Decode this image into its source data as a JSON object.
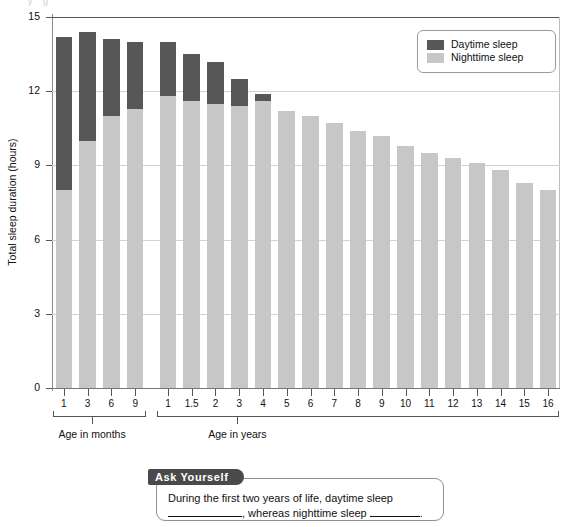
{
  "figure": {
    "top_cut_text": "y  g"
  },
  "chart_data": {
    "type": "bar",
    "stacked": true,
    "title": "",
    "xlabel": "",
    "ylabel": "Total sleep duration (hours)",
    "ylim": [
      0,
      15
    ],
    "yticks": [
      0,
      3,
      6,
      9,
      12,
      15
    ],
    "grid": true,
    "legend_position": "top-right",
    "group_labels": [
      "Age in months",
      "Age in years"
    ],
    "groups": [
      {
        "name": "Age in months",
        "categories": [
          "1",
          "3",
          "6",
          "9"
        ]
      },
      {
        "name": "Age in years",
        "categories": [
          "1",
          "1.5",
          "2",
          "3",
          "4",
          "5",
          "6",
          "7",
          "8",
          "9",
          "10",
          "11",
          "12",
          "13",
          "14",
          "15",
          "16"
        ]
      }
    ],
    "categories": [
      "1",
      "3",
      "6",
      "9",
      "1",
      "1.5",
      "2",
      "3",
      "4",
      "5",
      "6",
      "7",
      "8",
      "9",
      "10",
      "11",
      "12",
      "13",
      "14",
      "15",
      "16"
    ],
    "series": [
      {
        "name": "Nighttime sleep",
        "color": "#c7c7c7",
        "values": [
          8.0,
          10.0,
          11.0,
          11.3,
          11.8,
          11.6,
          11.5,
          11.4,
          11.6,
          11.2,
          11.0,
          10.7,
          10.4,
          10.2,
          9.8,
          9.5,
          9.3,
          9.1,
          8.8,
          8.3,
          8.0
        ]
      },
      {
        "name": "Daytime sleep",
        "color": "#575757",
        "values": [
          6.2,
          4.4,
          3.1,
          2.7,
          2.2,
          1.9,
          1.7,
          1.1,
          0.3,
          0.0,
          0.0,
          0.0,
          0.0,
          0.0,
          0.0,
          0.0,
          0.0,
          0.0,
          0.0,
          0.0,
          0.0
        ]
      }
    ],
    "totals": [
      14.2,
      14.4,
      14.1,
      14.0,
      14.0,
      13.5,
      13.2,
      12.5,
      11.9,
      11.2,
      11.0,
      10.7,
      10.4,
      10.2,
      9.8,
      9.5,
      9.3,
      9.1,
      8.8,
      8.3,
      8.0
    ]
  },
  "legend": {
    "items": [
      {
        "label": "Daytime sleep",
        "color": "#575757"
      },
      {
        "label": "Nighttime sleep",
        "color": "#c7c7c7"
      }
    ]
  },
  "ask_yourself": {
    "tag": "Ask Yourself",
    "text_before": "During the first two years of life, daytime sleep",
    "text_middle": ", whereas nighttime sleep",
    "text_end": "."
  }
}
